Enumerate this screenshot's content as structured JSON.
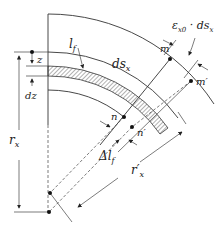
{
  "figure": {
    "type": "curved-beam-element-deformation",
    "labels": {
      "l_f": "l",
      "l_f_sub": "f",
      "ds_x": "ds",
      "ds_x_sub": "x",
      "strain": "ε",
      "strain_sub": "x0",
      "strain_mult": " · ds",
      "strain_mult_sub": "x",
      "m": "m",
      "m_prime": "m′",
      "n": "n",
      "n_prime": "n′",
      "z": "z",
      "dz": "dz",
      "r_x": "r",
      "r_x_sub": "x",
      "r_x_prime": "r′",
      "r_x_prime_sub": "x",
      "delta_l_f": "Δl",
      "delta_l_f_sub": "f"
    },
    "colors": {
      "line": "#333333",
      "hatch": "#555555",
      "background": "#ffffff"
    }
  }
}
